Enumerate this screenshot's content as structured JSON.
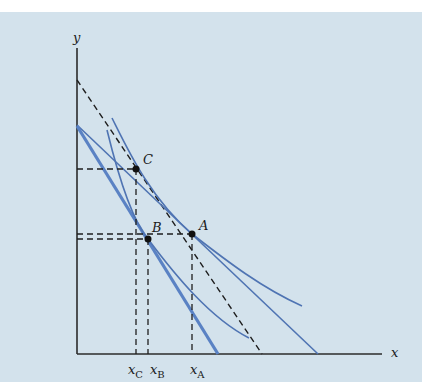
{
  "figure": {
    "type": "indifference-curve-diagram",
    "background_color": "#d3e2ec",
    "axes": {
      "x_label": "x",
      "y_label": "y",
      "color": "#2b2b2b"
    },
    "points": [
      {
        "name": "A",
        "label": "A"
      },
      {
        "name": "B",
        "label": "B"
      },
      {
        "name": "C",
        "label": "C"
      }
    ],
    "x_ticks": [
      {
        "base": "x",
        "sub": "C"
      },
      {
        "base": "x",
        "sub": "B"
      },
      {
        "base": "x",
        "sub": "A"
      }
    ],
    "colors": {
      "curve": "#4f74b3",
      "thick_budget_line": "#5a82c4",
      "dashed": "#1e1e1e",
      "point": "#111111"
    },
    "lines": [
      {
        "name": "original-budget-line-dashed",
        "style": "dashed"
      },
      {
        "name": "new-budget-line",
        "style": "solid"
      },
      {
        "name": "compensated-budget-line",
        "style": "solid-thick"
      },
      {
        "name": "indifference-curve-high",
        "style": "solid"
      },
      {
        "name": "indifference-curve-low",
        "style": "solid"
      }
    ]
  }
}
